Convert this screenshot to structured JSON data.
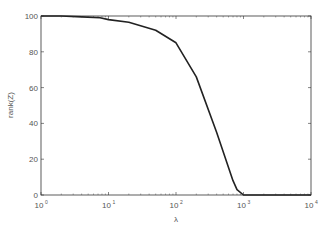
{
  "chart_data": {
    "type": "line",
    "title": "",
    "xlabel": "λ",
    "ylabel": "rank(Z)",
    "xscale": "log",
    "xlim": [
      1,
      10000
    ],
    "ylim": [
      0,
      100
    ],
    "grid": false,
    "legend": null,
    "xticks": [
      {
        "value": 1,
        "base": "10",
        "exp": "0"
      },
      {
        "value": 10,
        "base": "10",
        "exp": "1"
      },
      {
        "value": 100,
        "base": "10",
        "exp": "2"
      },
      {
        "value": 1000,
        "base": "10",
        "exp": "3"
      },
      {
        "value": 10000,
        "base": "10",
        "exp": "4"
      }
    ],
    "yticks": [
      0,
      20,
      40,
      60,
      80,
      100
    ],
    "series": [
      {
        "name": "rank(Z)",
        "color": "#222222",
        "x": [
          1,
          2,
          4,
          7.5,
          10,
          20,
          50,
          100,
          200,
          400,
          700,
          800,
          1000,
          2000,
          5000,
          10000
        ],
        "y": [
          100,
          100,
          99.5,
          99,
          98,
          96.5,
          92,
          85,
          66,
          35,
          8,
          3,
          0,
          0,
          0,
          0
        ]
      }
    ]
  },
  "colors": {
    "axis": "#333333",
    "line": "#222222",
    "text": "#555555",
    "background": "#ffffff"
  }
}
